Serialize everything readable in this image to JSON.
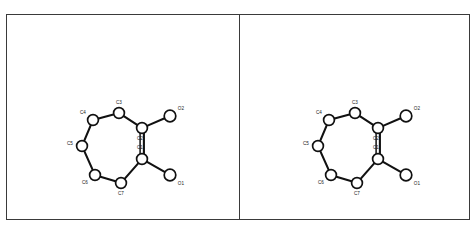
{
  "figure": {
    "kind": "stereo-pair",
    "panel_count": 2,
    "background_color": "#ffffff",
    "line_color": "#111111",
    "frame_color": "#3a3a3a"
  },
  "panels": [
    {
      "name": "left-eye-view",
      "label": ""
    },
    {
      "name": "right-eye-view",
      "label": ""
    }
  ],
  "molecule": {
    "name": "seven-membered ring with two oxygen substituents",
    "ring_size": 7,
    "atoms": [
      {
        "id": "C1",
        "label": "C1",
        "element": "C",
        "x": 135,
        "y": 144,
        "r": 5.4,
        "label_dx": -2,
        "label_dy": -11
      },
      {
        "id": "C2",
        "label": "C2",
        "element": "C",
        "x": 135,
        "y": 113,
        "r": 5.4,
        "label_dx": -2,
        "label_dy": 11
      },
      {
        "id": "C3",
        "label": "C3",
        "element": "C",
        "x": 112,
        "y": 98,
        "r": 5.4,
        "label_dx": 0,
        "label_dy": -10
      },
      {
        "id": "C4",
        "label": "C4",
        "element": "C",
        "x": 86,
        "y": 105,
        "r": 5.4,
        "label_dx": -10,
        "label_dy": -7
      },
      {
        "id": "C5",
        "label": "C5",
        "element": "C",
        "x": 75,
        "y": 131,
        "r": 5.4,
        "label_dx": -12,
        "label_dy": -2
      },
      {
        "id": "C6",
        "label": "C6",
        "element": "C",
        "x": 88,
        "y": 160,
        "r": 5.4,
        "label_dx": -10,
        "label_dy": 8
      },
      {
        "id": "C7",
        "label": "C7",
        "element": "C",
        "x": 114,
        "y": 168,
        "r": 5.4,
        "label_dx": 0,
        "label_dy": 11
      },
      {
        "id": "O2",
        "label": "O2",
        "element": "O",
        "x": 163,
        "y": 101,
        "r": 5.8,
        "label_dx": 11,
        "label_dy": -7
      },
      {
        "id": "O1",
        "label": "O1",
        "element": "O",
        "x": 163,
        "y": 160,
        "r": 5.8,
        "label_dx": 11,
        "label_dy": 9
      }
    ],
    "bonds": [
      {
        "from": "C1",
        "to": "C2",
        "order": 2
      },
      {
        "from": "C2",
        "to": "C3",
        "order": 1
      },
      {
        "from": "C3",
        "to": "C4",
        "order": 1
      },
      {
        "from": "C4",
        "to": "C5",
        "order": 1
      },
      {
        "from": "C5",
        "to": "C6",
        "order": 1
      },
      {
        "from": "C6",
        "to": "C7",
        "order": 1
      },
      {
        "from": "C7",
        "to": "C1",
        "order": 1
      },
      {
        "from": "C2",
        "to": "O2",
        "order": 1
      },
      {
        "from": "C1",
        "to": "O1",
        "order": 1
      }
    ],
    "stereo_offset_x": 3
  }
}
